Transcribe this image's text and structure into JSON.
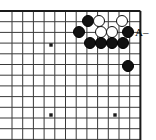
{
  "figure": {
    "kind": "go-board-diagram",
    "width": 156,
    "height": 140,
    "background_color": "#ffffff"
  },
  "board": {
    "line_color": "#3a3a3a",
    "border_color": "#1a1a1a",
    "line_width": 1,
    "border_width": 2,
    "spacing": 10.7,
    "origin_x": 12,
    "origin_y": 11,
    "columns": 13,
    "rows": 13,
    "edges": {
      "top": true,
      "left": false,
      "right": true,
      "bottom": false
    },
    "star_points": [
      {
        "name": "star-point-left-upper",
        "x": 51,
        "y": 45
      },
      {
        "name": "star-point-left-lower",
        "x": 51,
        "y": 115
      },
      {
        "name": "star-point-right-lower",
        "x": 115,
        "y": 115
      }
    ],
    "star_point_size": 3.4
  },
  "stones": {
    "radius": 6.0,
    "black_color": "#111111",
    "white_color": "#ffffff",
    "items": [
      {
        "name": "stone-black-r1-c1",
        "color": "black",
        "x": 88,
        "y": 21
      },
      {
        "name": "stone-white-r1-c2",
        "color": "white",
        "x": 99,
        "y": 21
      },
      {
        "name": "stone-white-r1-c4",
        "color": "white",
        "x": 122,
        "y": 21
      },
      {
        "name": "stone-black-r2-c0",
        "color": "black",
        "x": 79,
        "y": 32
      },
      {
        "name": "stone-white-r2-c2",
        "color": "white",
        "x": 101,
        "y": 32
      },
      {
        "name": "stone-white-r2-c3",
        "color": "white",
        "x": 112,
        "y": 32
      },
      {
        "name": "stone-black-r2-c4",
        "color": "black",
        "x": 128,
        "y": 32
      },
      {
        "name": "stone-black-r3-c1",
        "color": "black",
        "x": 90,
        "y": 43
      },
      {
        "name": "stone-black-r3-c2",
        "color": "black",
        "x": 101,
        "y": 43
      },
      {
        "name": "stone-black-r3-c3",
        "color": "black",
        "x": 112,
        "y": 43
      },
      {
        "name": "stone-black-r3-c4",
        "color": "black",
        "x": 123,
        "y": 43
      },
      {
        "name": "stone-black-isolated",
        "color": "black",
        "x": 128,
        "y": 66
      }
    ]
  },
  "annotations": {
    "items": [
      {
        "name": "point-label-a",
        "text": "A",
        "x": 135,
        "y": 27,
        "font_size": 11
      },
      {
        "name": "label-leader-dash",
        "text": "–",
        "x": 143,
        "y": 27,
        "font_size": 11
      }
    ]
  }
}
